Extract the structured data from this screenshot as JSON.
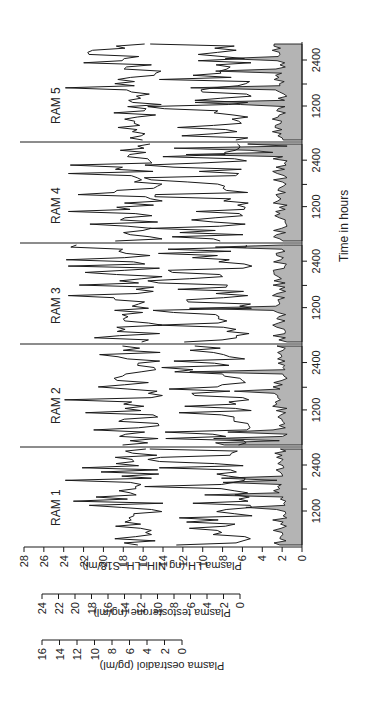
{
  "chart_data": {
    "type": "line",
    "title": "",
    "xlabel": "Time in hours",
    "y_axes": [
      {
        "label": "Plasma LH (ng NIH−LH−S18/ml)",
        "ticks": [
          0,
          2,
          4,
          6,
          8,
          10,
          12,
          14,
          16,
          18,
          20,
          22,
          24,
          26,
          28
        ],
        "range": [
          0,
          28
        ]
      },
      {
        "label": "Plasma testosterone (ng/ml)",
        "ticks": [
          0,
          2,
          4,
          6,
          8,
          10,
          12,
          14,
          16,
          18,
          20,
          22,
          24
        ],
        "range": [
          0,
          24
        ]
      },
      {
        "label": "Plasma oestradiol (pg/ml)",
        "ticks": [
          0,
          2,
          4,
          6,
          8,
          10,
          12,
          14,
          16
        ],
        "range": [
          0,
          16
        ]
      }
    ],
    "panels": [
      "RAM 1",
      "RAM 2",
      "RAM 3",
      "RAM 4",
      "RAM 5"
    ],
    "x_tick_labels": [
      "1200",
      "2400"
    ],
    "series": [
      {
        "name": "Plasma oestradiol (shaded area)",
        "fill": "#b4b4b4",
        "approx_level": "1-3 LH-axis units, with occasional peaks to ~8-15"
      },
      {
        "name": "Plasma testosterone (middle line)",
        "approx_range": "2-16 LH-axis units, pulsatile"
      },
      {
        "name": "Plasma LH (top line)",
        "approx_range": "13-25 ng/ml, pulsatile"
      }
    ],
    "peaks": [
      {
        "panel": "RAM 1",
        "series": "LH",
        "value": 24.5
      },
      {
        "panel": "RAM 4",
        "series": "LH",
        "value": 22.5
      },
      {
        "panel": "RAM 5",
        "series": "LH",
        "value": 20.5
      }
    ],
    "grid": false,
    "legend": "none"
  },
  "labels": {
    "ram1": "RAM 1",
    "ram2": "RAM 2",
    "ram3": "RAM 3",
    "ram4": "RAM 4",
    "ram5": "RAM 5",
    "xlabel": "Time in hours",
    "lh_axis": "Plasma LH (ng NIH−LH−S18/ml)",
    "t_axis": "Plasma testosterone (ng/ml)",
    "e_axis": "Plasma oestradiol (pg/ml)",
    "t1200": "1200",
    "t2400": "2400"
  },
  "colors": {
    "shade": "#b4b4b4",
    "line": "#1a1a1a"
  }
}
